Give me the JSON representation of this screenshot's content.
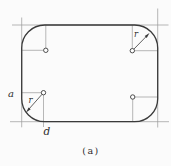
{
  "figure": {
    "caption": "(a)",
    "labels": {
      "a": "a",
      "d": "d",
      "r_top_right": "r",
      "r_bottom_left": "r"
    },
    "colors": {
      "background": "#fbfbfb",
      "line": "#3a3a3a",
      "thin_line": "#9a9a9a"
    }
  }
}
